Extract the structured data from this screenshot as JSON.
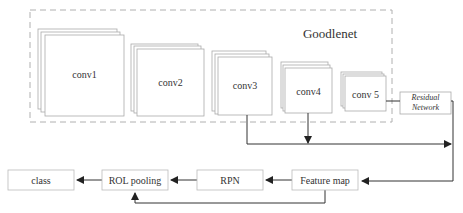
{
  "diagram": {
    "group_label": "Goodlenet",
    "layers": [
      {
        "id": "conv1",
        "label": "conv1"
      },
      {
        "id": "conv2",
        "label": "conv2"
      },
      {
        "id": "conv3",
        "label": "conv3"
      },
      {
        "id": "conv4",
        "label": "conv4"
      },
      {
        "id": "conv5",
        "label": "conv 5"
      }
    ],
    "residual": {
      "line1": "Residual",
      "line2": "Network"
    },
    "pipeline": [
      {
        "id": "class",
        "label": "class"
      },
      {
        "id": "rol_pooling",
        "label": "ROL pooling"
      },
      {
        "id": "rpn",
        "label": "RPN"
      },
      {
        "id": "feature_map",
        "label": "Feature map"
      }
    ],
    "colors": {
      "line": "#333333",
      "box_border": "#aaaaaa",
      "dashed_border": "#b0b0b0"
    }
  }
}
